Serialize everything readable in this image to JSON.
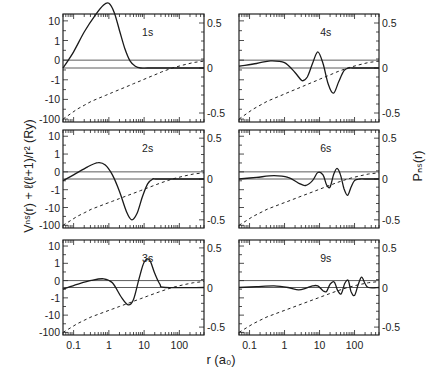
{
  "chart_data": {
    "type": "line",
    "layout": "3x2 panel grid",
    "xlabel": "r (a₀)",
    "ylabel_left": "Vⁿˢ(r) + ℓ(ℓ+1)/r² (Ry)",
    "ylabel_right": "Pₙₛ(r)",
    "xscale": "log",
    "xlim": [
      0.05,
      500
    ],
    "x_ticks": [
      "0.1",
      "1",
      "10",
      "100"
    ],
    "x_tick_values": [
      0.1,
      1,
      10,
      100
    ],
    "left_yscale": "symlog",
    "left_y_ticks": [
      "10",
      "1",
      "0",
      "-1",
      "-10",
      "-100"
    ],
    "left_y_tick_values": [
      10,
      1,
      0,
      -1,
      -10,
      -100
    ],
    "right_y_ticks": [
      "0.5",
      "0",
      "-0.5"
    ],
    "right_y_tick_values": [
      0.5,
      0,
      -0.5
    ],
    "right_ylim": [
      -0.6,
      0.6
    ],
    "series_legend": {
      "solid": "radial wavefunction P_ns(r) (right axis)",
      "dashed": "effective potential V(r) + l(l+1)/r^2 (left axis)"
    },
    "panels": [
      {
        "label": "1s",
        "wavefunction": {
          "log10_r": [
            -1.3,
            -1.0,
            -0.7,
            -0.4,
            -0.15,
            0.0,
            0.15,
            0.3,
            0.45,
            0.6,
            0.75,
            0.9,
            1.1,
            1.4,
            2.7
          ],
          "P": [
            0.0,
            0.18,
            0.4,
            0.58,
            0.7,
            0.72,
            0.62,
            0.42,
            0.22,
            0.08,
            0.02,
            0.0,
            0.0,
            0.0,
            0.0
          ]
        }
      },
      {
        "label": "2s",
        "wavefunction": {
          "log10_r": [
            -1.3,
            -1.0,
            -0.6,
            -0.3,
            -0.1,
            0.1,
            0.3,
            0.5,
            0.65,
            0.8,
            0.95,
            1.1,
            1.25,
            1.4,
            2.7
          ],
          "P": [
            -0.02,
            0.05,
            0.15,
            0.2,
            0.17,
            0.05,
            -0.15,
            -0.4,
            -0.5,
            -0.42,
            -0.22,
            -0.06,
            0.0,
            0.0,
            0.0
          ]
        }
      },
      {
        "label": "3s",
        "wavefunction": {
          "log10_r": [
            -1.3,
            -0.9,
            -0.5,
            -0.15,
            0.1,
            0.35,
            0.55,
            0.7,
            0.85,
            1.0,
            1.15,
            1.3,
            1.45,
            1.6,
            2.7
          ],
          "P": [
            -0.02,
            0.04,
            0.09,
            0.11,
            0.06,
            -0.12,
            -0.22,
            -0.15,
            0.1,
            0.32,
            0.35,
            0.18,
            0.04,
            0.0,
            0.0
          ]
        }
      },
      {
        "label": "4s",
        "wavefunction": {
          "log10_r": [
            -1.3,
            -0.8,
            -0.4,
            0.0,
            0.3,
            0.5,
            0.65,
            0.8,
            0.95,
            1.1,
            1.25,
            1.4,
            1.55,
            1.7,
            1.85,
            2.0,
            2.7
          ],
          "P": [
            0.02,
            0.05,
            0.08,
            0.06,
            -0.05,
            -0.14,
            -0.1,
            0.05,
            0.18,
            0.05,
            -0.18,
            -0.28,
            -0.15,
            -0.03,
            0.0,
            0.0,
            0.0
          ]
        }
      },
      {
        "label": "6s",
        "wavefunction": {
          "log10_r": [
            -1.3,
            -0.8,
            -0.3,
            0.1,
            0.4,
            0.6,
            0.8,
            0.95,
            1.1,
            1.2,
            1.3,
            1.4,
            1.5,
            1.6,
            1.7,
            1.8,
            1.9,
            2.0,
            2.15,
            2.3,
            2.7
          ],
          "P": [
            0.0,
            0.02,
            0.04,
            0.02,
            -0.05,
            -0.08,
            -0.02,
            0.08,
            0.05,
            -0.07,
            -0.1,
            0.05,
            0.13,
            0.05,
            -0.12,
            -0.2,
            -0.1,
            -0.02,
            0.0,
            0.0,
            0.0
          ]
        }
      },
      {
        "label": "9s",
        "wavefunction": {
          "log10_r": [
            -1.3,
            -0.8,
            -0.3,
            0.1,
            0.4,
            0.6,
            0.8,
            0.95,
            1.1,
            1.2,
            1.3,
            1.42,
            1.52,
            1.62,
            1.72,
            1.82,
            1.9,
            2.0,
            2.1,
            2.2,
            2.3,
            2.4,
            2.7
          ],
          "P": [
            0.0,
            0.01,
            0.02,
            0.0,
            -0.03,
            -0.01,
            0.02,
            0.02,
            -0.04,
            -0.05,
            0.04,
            0.07,
            -0.04,
            -0.08,
            0.05,
            0.09,
            -0.05,
            -0.1,
            0.03,
            0.13,
            0.05,
            0.0,
            0.0
          ]
        }
      }
    ],
    "potential_curve": {
      "description": "dashed effective potential, same in all panels; rises from about -100 Ry at small r toward 0 at large r",
      "log10_r": [
        -1.3,
        -1.1,
        -0.9,
        -0.7,
        -0.5,
        -0.3,
        -0.1,
        0.1,
        0.3,
        0.5,
        0.7,
        0.9,
        1.1,
        1.3,
        1.5,
        1.8,
        2.1,
        2.4,
        2.7
      ],
      "V_symlog_units": [
        -3.0,
        -2.75,
        -2.5,
        -2.3,
        -2.1,
        -1.95,
        -1.8,
        -1.65,
        -1.5,
        -1.35,
        -1.2,
        -1.05,
        -0.9,
        -0.75,
        -0.6,
        -0.4,
        -0.25,
        -0.12,
        -0.05
      ]
    }
  }
}
